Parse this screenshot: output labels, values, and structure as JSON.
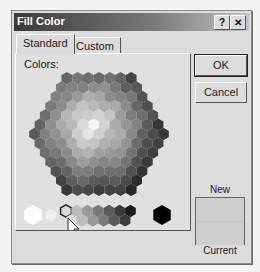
{
  "window": {
    "title": "Fill Color",
    "help_label": "?",
    "close_label": "✕"
  },
  "tabs": [
    {
      "label": "Standard",
      "active": true
    },
    {
      "label": "Custom",
      "active": false
    }
  ],
  "panel": {
    "colors_label": "Colors:"
  },
  "buttons": {
    "ok_label": "OK",
    "cancel_label": "Cancel"
  },
  "preview": {
    "new_label": "New",
    "current_label": "Current",
    "new_color": "#cfcfcf",
    "current_color": "#cfcfcf"
  },
  "palette": {
    "selected_index": 2,
    "grayscale_row": [
      "#ffffff",
      "#f0f0f0",
      "#dadada",
      "#bcbcbc",
      "#9a9a9a",
      "#7a7a7a",
      "#5a5a5a",
      "#3a3a3a",
      "#1c1c1c",
      "#000000"
    ]
  }
}
